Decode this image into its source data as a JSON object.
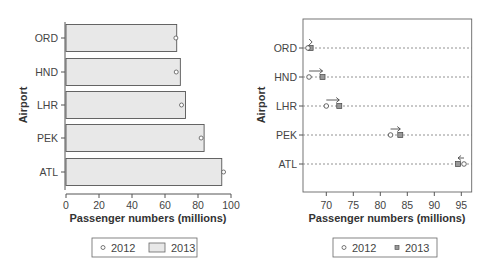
{
  "chart_data": [
    {
      "type": "bar",
      "orientation": "horizontal",
      "title": "",
      "xlabel": "Passenger numbers (millions)",
      "ylabel": "Airport",
      "categories": [
        "ORD",
        "HND",
        "LHR",
        "PEK",
        "ATL"
      ],
      "xlim": [
        0,
        100
      ],
      "xticks": [
        0,
        20,
        40,
        60,
        80,
        100
      ],
      "series": [
        {
          "name": "2013",
          "style": "bar",
          "values": [
            67.1,
            69.3,
            72.4,
            83.7,
            94.4
          ]
        },
        {
          "name": "2012",
          "style": "open-circle",
          "values": [
            66.6,
            66.8,
            70.0,
            81.9,
            95.5
          ]
        }
      ],
      "legend": {
        "position": "bottom",
        "entries": [
          "2012",
          "2013"
        ]
      },
      "grid": false
    },
    {
      "type": "scatter",
      "subtype": "dot-plot-with-arrows",
      "title": "",
      "xlabel": "Passenger numbers (millions)",
      "ylabel": "Airport",
      "categories": [
        "ORD",
        "HND",
        "LHR",
        "PEK",
        "ATL"
      ],
      "xlim": [
        65.7,
        96.8
      ],
      "xticks": [
        70,
        75,
        80,
        85,
        90,
        95
      ],
      "series": [
        {
          "name": "2012",
          "marker": "open-circle",
          "values": [
            66.6,
            66.8,
            70.0,
            81.9,
            95.5
          ]
        },
        {
          "name": "2013",
          "marker": "filled-square",
          "values": [
            67.1,
            69.3,
            72.4,
            83.7,
            94.4
          ]
        }
      ],
      "annotations": [
        {
          "category": "ORD",
          "arrow": "right",
          "from": 66.6,
          "to": 67.1
        },
        {
          "category": "HND",
          "arrow": "right",
          "from": 66.8,
          "to": 69.3
        },
        {
          "category": "LHR",
          "arrow": "right",
          "from": 70.0,
          "to": 72.4
        },
        {
          "category": "PEK",
          "arrow": "right",
          "from": 81.9,
          "to": 83.7
        },
        {
          "category": "ATL",
          "arrow": "left",
          "from": 95.5,
          "to": 94.4
        }
      ],
      "legend": {
        "position": "bottom",
        "entries": [
          "2012",
          "2013"
        ]
      },
      "grid": "dotted horizontal guide lines"
    }
  ],
  "left_chart": {
    "ylabel": "Airport",
    "xlabel": "Passenger numbers (millions)",
    "xticks": [
      "0",
      "20",
      "40",
      "60",
      "80",
      "100"
    ],
    "categories": [
      "ORD",
      "HND",
      "LHR",
      "PEK",
      "ATL"
    ],
    "legend": {
      "item1": "2012",
      "item2": "2013"
    }
  },
  "right_chart": {
    "ylabel": "Airport",
    "xlabel": "Passenger numbers (millions)",
    "xticks": [
      "70",
      "75",
      "80",
      "85",
      "90",
      "95"
    ],
    "categories": [
      "ORD",
      "HND",
      "LHR",
      "PEK",
      "ATL"
    ],
    "legend": {
      "item1": "2012",
      "item2": "2013"
    }
  },
  "colors": {
    "bar_fill": "#e8e8e8",
    "outline": "#555555",
    "square_fill": "#999999",
    "dotted_line": "#777777"
  }
}
